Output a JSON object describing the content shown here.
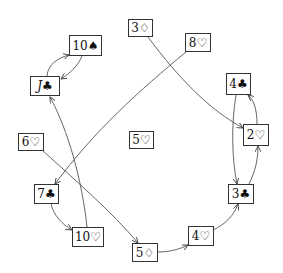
{
  "diagram": {
    "type": "directed-graph",
    "nodes": [
      {
        "id": "10S",
        "label": "10♠",
        "rank": "10",
        "suit": "♠",
        "x": 69,
        "y": 35,
        "w": 33,
        "h": 21
      },
      {
        "id": "JC",
        "label": "J♣",
        "rank": "J",
        "suit": "♣",
        "x": 30,
        "y": 76,
        "w": 30,
        "h": 20,
        "italic": true
      },
      {
        "id": "3D",
        "label": "3♢",
        "rank": "3",
        "suit": "♢",
        "x": 128,
        "y": 19,
        "w": 25,
        "h": 18
      },
      {
        "id": "8H",
        "label": "8♡",
        "rank": "8",
        "suit": "♡",
        "x": 185,
        "y": 33,
        "w": 26,
        "h": 19
      },
      {
        "id": "4C",
        "label": "4♣",
        "rank": "4",
        "suit": "♣",
        "x": 226,
        "y": 73,
        "w": 25,
        "h": 22
      },
      {
        "id": "2H",
        "label": "2♡",
        "rank": "2",
        "suit": "♡",
        "x": 243,
        "y": 124,
        "w": 26,
        "h": 22
      },
      {
        "id": "3C",
        "label": "3♣",
        "rank": "3",
        "suit": "♣",
        "x": 228,
        "y": 184,
        "w": 26,
        "h": 20
      },
      {
        "id": "4H",
        "label": "4♡",
        "rank": "4",
        "suit": "♡",
        "x": 188,
        "y": 226,
        "w": 26,
        "h": 20
      },
      {
        "id": "5D",
        "label": "5♢",
        "rank": "5",
        "suit": "♢",
        "x": 132,
        "y": 243,
        "w": 26,
        "h": 19
      },
      {
        "id": "10H",
        "label": "10♡",
        "rank": "10",
        "suit": "♡",
        "x": 72,
        "y": 227,
        "w": 32,
        "h": 20
      },
      {
        "id": "7C",
        "label": "7♣",
        "rank": "7",
        "suit": "♣",
        "x": 34,
        "y": 184,
        "w": 25,
        "h": 20
      },
      {
        "id": "6H",
        "label": "6♡",
        "rank": "6",
        "suit": "♡",
        "x": 18,
        "y": 133,
        "w": 26,
        "h": 18
      },
      {
        "id": "5H",
        "label": "5♡",
        "rank": "5",
        "suit": "♡",
        "x": 129,
        "y": 131,
        "w": 25,
        "h": 18
      }
    ],
    "edges": [
      {
        "from": "JC",
        "to": "10S"
      },
      {
        "from": "10S",
        "to": "JC"
      },
      {
        "from": "10H",
        "to": "JC"
      },
      {
        "from": "8H",
        "to": "7C"
      },
      {
        "from": "3D",
        "to": "2H"
      },
      {
        "from": "4C",
        "to": "3C"
      },
      {
        "from": "2H",
        "to": "4C"
      },
      {
        "from": "3C",
        "to": "2H"
      },
      {
        "from": "4H",
        "to": "3C"
      },
      {
        "from": "5D",
        "to": "4H"
      },
      {
        "from": "6H",
        "to": "5D"
      },
      {
        "from": "7C",
        "to": "10H"
      }
    ]
  }
}
